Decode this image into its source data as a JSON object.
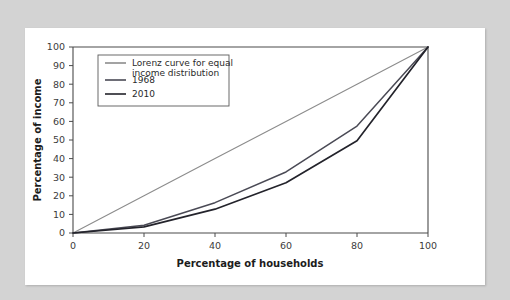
{
  "chart_data": {
    "type": "line",
    "title": "",
    "subtitle": "",
    "xlabel": "Percentage of households",
    "ylabel": "Percentage of income",
    "xlim": [
      0,
      100
    ],
    "ylim": [
      0,
      100
    ],
    "xticks": [
      0,
      20,
      40,
      60,
      80,
      100
    ],
    "yticks": [
      0,
      10,
      20,
      30,
      40,
      50,
      60,
      70,
      80,
      90,
      100
    ],
    "xtick_labels": [
      "0",
      "20",
      "40",
      "60",
      "80",
      "100"
    ],
    "ytick_labels": [
      "0",
      "10",
      "20",
      "30",
      "40",
      "50",
      "60",
      "70",
      "80",
      "90",
      "100"
    ],
    "grid": false,
    "legend_position": "upper-left-inside",
    "x": [
      0,
      20,
      40,
      60,
      80,
      100
    ],
    "series": [
      {
        "name": "Lorenz curve for equal income distribution",
        "color": "#8c8c8c",
        "width": 1.1,
        "values": [
          0,
          20,
          40,
          60,
          80,
          100
        ]
      },
      {
        "name": "1968",
        "color": "#4a4a55",
        "width": 1.5,
        "values": [
          0,
          4.2,
          16.3,
          32.8,
          57.5,
          100
        ]
      },
      {
        "name": "2010",
        "color": "#23232b",
        "width": 1.7,
        "values": [
          0,
          3.3,
          12.8,
          27.0,
          49.6,
          100
        ]
      }
    ],
    "annotations": []
  },
  "legend": {
    "entries": [
      {
        "label_line1": "Lorenz curve for equal",
        "label_line2": "income distribution"
      },
      {
        "label_line1": "1968",
        "label_line2": ""
      },
      {
        "label_line1": "2010",
        "label_line2": ""
      }
    ]
  },
  "colors": {
    "page_background": "#d3d3d3",
    "card_background": "#ffffff",
    "axis": "#4a4a4a",
    "text": "#1c1c1c"
  }
}
